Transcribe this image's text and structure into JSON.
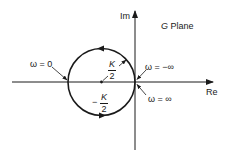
{
  "diagram": {
    "title": "G Plane",
    "title_italic_part": "G",
    "title_rest": "Plane",
    "axes": {
      "x_label": "Re",
      "y_label": "Im"
    },
    "circle": {
      "center_label_sign": "−",
      "center_label_num": "K",
      "center_label_den": "2",
      "radius_label_num": "K",
      "radius_label_den": "2"
    },
    "annotations": {
      "omega_zero": "ω = 0",
      "omega_neg_inf": "ω = −∞",
      "omega_pos_inf": "ω = ∞"
    },
    "colors": {
      "ink": "#1a1a1a",
      "background": "#ffffff"
    }
  }
}
